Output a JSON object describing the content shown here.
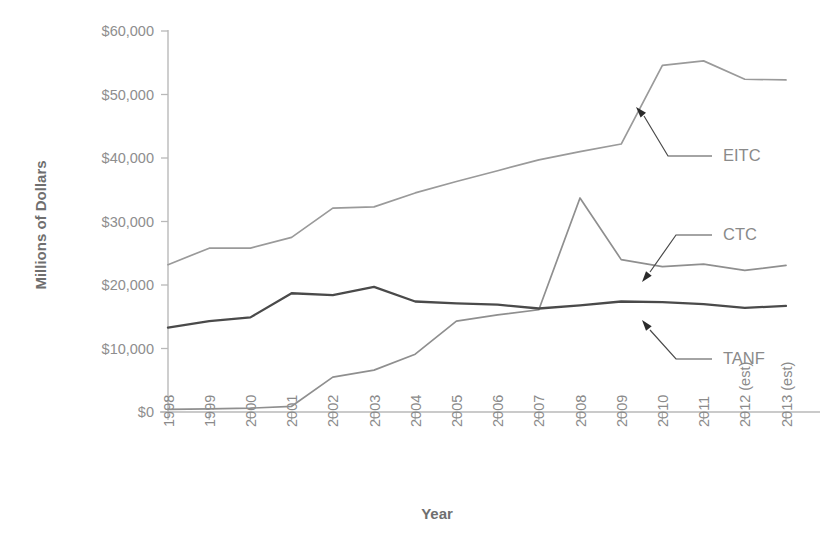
{
  "chart_data": {
    "type": "line",
    "title": "",
    "xlabel": "Year",
    "ylabel": "Millions of Dollars",
    "categories": [
      "1998",
      "1999",
      "2000",
      "2001",
      "2002",
      "2003",
      "2004",
      "2005",
      "2006",
      "2007",
      "2008",
      "2009",
      "2010",
      "2011",
      "2012 (est)",
      "2013 (est)"
    ],
    "ylim": [
      0,
      60000
    ],
    "yticks": [
      0,
      10000,
      20000,
      30000,
      40000,
      50000,
      60000
    ],
    "ytick_labels": [
      "$0",
      "$10,000",
      "$20,000",
      "$30,000",
      "$40,000",
      "$50,000",
      "$60,000"
    ],
    "grid": false,
    "legend_position": "inline-annotations",
    "series": [
      {
        "name": "EITC",
        "color": "#9a9a9a",
        "values": [
          23200,
          25800,
          25800,
          27500,
          32100,
          32300,
          34500,
          36300,
          38000,
          39700,
          41000,
          42200,
          54600,
          55300,
          52400,
          52300
        ]
      },
      {
        "name": "CTC",
        "color": "#8f8f8f",
        "values": [
          400,
          500,
          600,
          900,
          5500,
          6600,
          9100,
          14300,
          15300,
          16100,
          33700,
          24000,
          22900,
          23300,
          22300,
          23100
        ]
      },
      {
        "name": "TANF",
        "color": "#4a4a4a",
        "values": [
          13300,
          14300,
          14900,
          18700,
          18400,
          19700,
          17400,
          17100,
          16900,
          16300,
          16800,
          17400,
          17300,
          17000,
          16400,
          16700
        ]
      }
    ],
    "annotations": [
      {
        "label": "EITC",
        "points_to_year": "2010"
      },
      {
        "label": "CTC",
        "points_to_year": "2009"
      },
      {
        "label": "TANF",
        "points_to_year": "2010"
      }
    ]
  },
  "axes": {
    "ylabel": "Millions of Dollars",
    "xlabel": "Year"
  }
}
